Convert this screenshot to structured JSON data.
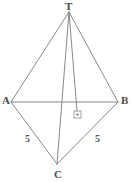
{
  "figure": {
    "kind": "geometry-diagram",
    "canvas": {
      "width": 132,
      "height": 182,
      "background": "#ffffff"
    },
    "style": {
      "stroke_color": "#7b7b7b",
      "stroke_width": 0.9,
      "label_color": "#4a4a4a",
      "side_label_color": "#5a5a5a"
    },
    "vertices": [
      {
        "id": "T",
        "label": "T",
        "x": 69,
        "y": 12,
        "label_x": 65,
        "label_y": 1
      },
      {
        "id": "A",
        "label": "A",
        "x": 11,
        "y": 102,
        "label_x": 2,
        "label_y": 95
      },
      {
        "id": "B",
        "label": "B",
        "x": 118,
        "y": 102,
        "label_x": 121,
        "label_y": 95
      },
      {
        "id": "C",
        "label": "C",
        "x": 57,
        "y": 164,
        "label_x": 54,
        "label_y": 169
      }
    ],
    "foot": {
      "id": "H",
      "x": 77,
      "y": 111
    },
    "edges": [
      {
        "id": "TA",
        "from": "T",
        "to": "A",
        "x1": 69,
        "y1": 12,
        "x2": 11,
        "y2": 102
      },
      {
        "id": "TB",
        "from": "T",
        "to": "B",
        "x1": 69,
        "y1": 12,
        "x2": 118,
        "y2": 102
      },
      {
        "id": "TC",
        "from": "T",
        "to": "C",
        "x1": 69,
        "y1": 12,
        "x2": 57,
        "y2": 164
      },
      {
        "id": "AB",
        "from": "A",
        "to": "B",
        "x1": 11,
        "y1": 102,
        "x2": 118,
        "y2": 102
      },
      {
        "id": "AC",
        "from": "A",
        "to": "C",
        "x1": 11,
        "y1": 102,
        "x2": 57,
        "y2": 164
      },
      {
        "id": "CB",
        "from": "C",
        "to": "B",
        "x1": 57,
        "y1": 164,
        "x2": 118,
        "y2": 102
      },
      {
        "id": "TH",
        "from": "T",
        "to": "H",
        "x1": 69,
        "y1": 12,
        "x2": 77,
        "y2": 111
      }
    ],
    "right_angle_marker": {
      "id": "right-angle-at-foot",
      "x": 74,
      "y": 111,
      "size": 7,
      "inner_dot": {
        "x": 77,
        "y": 115,
        "r": 1.1
      }
    },
    "side_labels": [
      {
        "id": "side-AC",
        "text": "5",
        "edge": "AC",
        "x": 25,
        "y": 134
      },
      {
        "id": "side-CB",
        "text": "5",
        "edge": "CB",
        "x": 95,
        "y": 134
      }
    ]
  }
}
